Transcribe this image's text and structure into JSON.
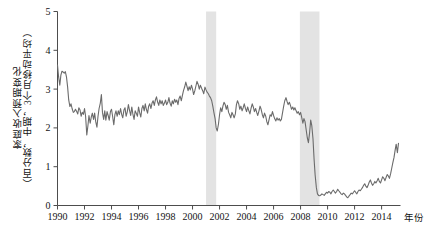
{
  "chart_data": {
    "type": "line",
    "title": "",
    "xlabel": "年份",
    "ylabel_lines": [
      "家庭收入预期变化",
      "（百分数，中期，3个月移动平均）"
    ],
    "ylabel": "家庭收入预期变化（百分数，中期，3个月移动平均）",
    "xlim": [
      1990,
      2015.4
    ],
    "ylim": [
      0,
      5
    ],
    "ytick_labels": [
      "0",
      "1",
      "2",
      "3",
      "4",
      "5"
    ],
    "yticks": [
      0,
      1,
      2,
      3,
      4,
      5
    ],
    "xtick_labels": [
      "1990",
      "1992",
      "1994",
      "1996",
      "1998",
      "2000",
      "2002",
      "2004",
      "2006",
      "2008",
      "2010",
      "2012",
      "2014"
    ],
    "xticks": [
      1990,
      1992,
      1994,
      1996,
      1998,
      2000,
      2002,
      2004,
      2006,
      2008,
      2010,
      2012,
      2014
    ],
    "grid": false,
    "legend": null,
    "line_color": "#6b6b6b",
    "shade_color": "#e3e3e3",
    "axis_color": "#4d4d4d",
    "recession_bands": [
      {
        "start": 2001.0,
        "end": 2001.75
      },
      {
        "start": 2007.95,
        "end": 2009.4
      }
    ],
    "series": [
      {
        "name": "家庭收入预期变化",
        "x": [
          1990.0,
          1990.08,
          1990.17,
          1990.25,
          1990.33,
          1990.42,
          1990.5,
          1990.58,
          1990.67,
          1990.75,
          1990.83,
          1990.92,
          1991.0,
          1991.08,
          1991.17,
          1991.25,
          1991.33,
          1991.42,
          1991.5,
          1991.58,
          1991.67,
          1991.75,
          1991.83,
          1991.92,
          1992.0,
          1992.08,
          1992.17,
          1992.25,
          1992.33,
          1992.42,
          1992.5,
          1992.58,
          1992.67,
          1992.75,
          1992.83,
          1992.92,
          1993.0,
          1993.08,
          1993.17,
          1993.25,
          1993.33,
          1993.42,
          1993.5,
          1993.58,
          1993.67,
          1993.75,
          1993.83,
          1993.92,
          1994.0,
          1994.08,
          1994.17,
          1994.25,
          1994.33,
          1994.42,
          1994.5,
          1994.58,
          1994.67,
          1994.75,
          1994.83,
          1994.92,
          1995.0,
          1995.08,
          1995.17,
          1995.25,
          1995.33,
          1995.42,
          1995.5,
          1995.58,
          1995.67,
          1995.75,
          1995.83,
          1995.92,
          1996.0,
          1996.08,
          1996.17,
          1996.25,
          1996.33,
          1996.42,
          1996.5,
          1996.58,
          1996.67,
          1996.75,
          1996.83,
          1996.92,
          1997.0,
          1997.08,
          1997.17,
          1997.25,
          1997.33,
          1997.42,
          1997.5,
          1997.58,
          1997.67,
          1997.75,
          1997.83,
          1997.92,
          1998.0,
          1998.08,
          1998.17,
          1998.25,
          1998.33,
          1998.42,
          1998.5,
          1998.58,
          1998.67,
          1998.75,
          1998.83,
          1998.92,
          1999.0,
          1999.08,
          1999.17,
          1999.25,
          1999.33,
          1999.42,
          1999.5,
          1999.58,
          1999.67,
          1999.75,
          1999.83,
          1999.92,
          2000.0,
          2000.08,
          2000.17,
          2000.25,
          2000.33,
          2000.42,
          2000.5,
          2000.58,
          2000.67,
          2000.75,
          2000.83,
          2000.92,
          2001.0,
          2001.08,
          2001.17,
          2001.25,
          2001.33,
          2001.42,
          2001.5,
          2001.58,
          2001.67,
          2001.75,
          2001.83,
          2001.92,
          2002.0,
          2002.08,
          2002.17,
          2002.25,
          2002.33,
          2002.42,
          2002.5,
          2002.58,
          2002.67,
          2002.75,
          2002.83,
          2002.92,
          2003.0,
          2003.08,
          2003.17,
          2003.25,
          2003.33,
          2003.42,
          2003.5,
          2003.58,
          2003.67,
          2003.75,
          2003.83,
          2003.92,
          2004.0,
          2004.08,
          2004.17,
          2004.25,
          2004.33,
          2004.42,
          2004.5,
          2004.58,
          2004.67,
          2004.75,
          2004.83,
          2004.92,
          2005.0,
          2005.08,
          2005.17,
          2005.25,
          2005.33,
          2005.42,
          2005.5,
          2005.58,
          2005.67,
          2005.75,
          2005.83,
          2005.92,
          2006.0,
          2006.08,
          2006.17,
          2006.25,
          2006.33,
          2006.42,
          2006.5,
          2006.58,
          2006.67,
          2006.75,
          2006.83,
          2006.92,
          2007.0,
          2007.08,
          2007.17,
          2007.25,
          2007.33,
          2007.42,
          2007.5,
          2007.58,
          2007.67,
          2007.75,
          2007.83,
          2007.92,
          2008.0,
          2008.08,
          2008.17,
          2008.25,
          2008.33,
          2008.42,
          2008.5,
          2008.58,
          2008.67,
          2008.75,
          2008.83,
          2008.92,
          2009.0,
          2009.08,
          2009.17,
          2009.25,
          2009.33,
          2009.42,
          2009.5,
          2009.58,
          2009.67,
          2009.75,
          2009.83,
          2009.92,
          2010.0,
          2010.08,
          2010.17,
          2010.25,
          2010.33,
          2010.42,
          2010.5,
          2010.58,
          2010.67,
          2010.75,
          2010.83,
          2010.92,
          2011.0,
          2011.08,
          2011.17,
          2011.25,
          2011.33,
          2011.42,
          2011.5,
          2011.58,
          2011.67,
          2011.75,
          2011.83,
          2011.92,
          2012.0,
          2012.08,
          2012.17,
          2012.25,
          2012.33,
          2012.42,
          2012.5,
          2012.58,
          2012.67,
          2012.75,
          2012.83,
          2012.92,
          2013.0,
          2013.08,
          2013.17,
          2013.25,
          2013.33,
          2013.42,
          2013.5,
          2013.58,
          2013.67,
          2013.75,
          2013.83,
          2013.92,
          2014.0,
          2014.08,
          2014.17,
          2014.25,
          2014.33,
          2014.42,
          2014.5,
          2014.58,
          2014.67,
          2014.75,
          2014.83,
          2014.92,
          2015.0,
          2015.08,
          2015.17,
          2015.25
        ],
        "values": [
          3.62,
          3.32,
          3.1,
          3.36,
          3.46,
          3.44,
          3.41,
          3.45,
          3.3,
          3.05,
          2.72,
          2.55,
          2.62,
          2.5,
          2.4,
          2.42,
          2.48,
          2.42,
          2.36,
          2.52,
          2.46,
          2.3,
          2.4,
          2.35,
          2.5,
          2.3,
          1.82,
          2.05,
          2.32,
          2.12,
          2.28,
          2.38,
          2.22,
          2.38,
          2.16,
          2.02,
          2.3,
          2.5,
          2.64,
          2.86,
          2.4,
          2.22,
          2.44,
          2.2,
          2.42,
          2.32,
          2.2,
          2.42,
          2.48,
          2.3,
          2.08,
          2.34,
          2.44,
          2.3,
          2.44,
          2.34,
          2.5,
          2.35,
          2.26,
          2.46,
          2.52,
          2.3,
          2.42,
          2.6,
          2.46,
          2.32,
          2.54,
          2.36,
          2.22,
          2.44,
          2.38,
          2.3,
          2.54,
          2.4,
          2.28,
          2.5,
          2.58,
          2.44,
          2.62,
          2.48,
          2.38,
          2.56,
          2.62,
          2.5,
          2.64,
          2.7,
          2.58,
          2.72,
          2.8,
          2.66,
          2.58,
          2.72,
          2.62,
          2.7,
          2.58,
          2.64,
          2.72,
          2.6,
          2.66,
          2.78,
          2.64,
          2.56,
          2.7,
          2.62,
          2.74,
          2.66,
          2.72,
          2.6,
          2.76,
          2.82,
          2.7,
          2.84,
          2.96,
          3.06,
          3.18,
          3.08,
          2.96,
          3.06,
          2.98,
          3.1,
          3.0,
          2.86,
          2.96,
          3.08,
          3.2,
          3.12,
          3.0,
          3.1,
          3.02,
          2.96,
          2.88,
          3.05,
          2.98,
          2.92,
          2.88,
          2.82,
          2.78,
          2.7,
          2.56,
          2.4,
          2.24,
          2.0,
          1.92,
          2.1,
          2.34,
          2.52,
          2.42,
          2.56,
          2.66,
          2.6,
          2.48,
          2.58,
          2.4,
          2.34,
          2.26,
          2.4,
          2.34,
          2.26,
          2.36,
          2.6,
          2.7,
          2.62,
          2.48,
          2.56,
          2.44,
          2.52,
          2.62,
          2.5,
          2.42,
          2.54,
          2.44,
          2.36,
          2.5,
          2.62,
          2.54,
          2.42,
          2.5,
          2.4,
          2.32,
          2.44,
          2.56,
          2.48,
          2.34,
          2.26,
          2.38,
          2.3,
          2.16,
          2.08,
          2.22,
          2.34,
          2.3,
          2.42,
          2.32,
          2.24,
          2.18,
          2.26,
          2.2,
          2.24,
          2.18,
          2.22,
          2.4,
          2.56,
          2.7,
          2.78,
          2.68,
          2.6,
          2.66,
          2.58,
          2.48,
          2.54,
          2.46,
          2.52,
          2.44,
          2.38,
          2.42,
          2.34,
          2.4,
          2.28,
          2.12,
          2.24,
          2.16,
          1.94,
          1.74,
          1.62,
          1.88,
          2.2,
          2.06,
          1.72,
          1.2,
          0.78,
          0.46,
          0.3,
          0.26,
          0.25,
          0.27,
          0.3,
          0.28,
          0.26,
          0.3,
          0.34,
          0.32,
          0.36,
          0.34,
          0.3,
          0.36,
          0.4,
          0.36,
          0.32,
          0.36,
          0.42,
          0.38,
          0.34,
          0.3,
          0.28,
          0.32,
          0.3,
          0.26,
          0.22,
          0.2,
          0.24,
          0.28,
          0.32,
          0.3,
          0.34,
          0.38,
          0.34,
          0.3,
          0.36,
          0.4,
          0.38,
          0.42,
          0.46,
          0.52,
          0.56,
          0.5,
          0.46,
          0.52,
          0.6,
          0.66,
          0.58,
          0.52,
          0.56,
          0.62,
          0.58,
          0.64,
          0.7,
          0.62,
          0.58,
          0.66,
          0.74,
          0.7,
          0.64,
          0.72,
          0.8,
          0.76,
          0.7,
          0.82,
          0.96,
          1.1,
          1.24,
          1.42,
          1.58,
          1.36,
          1.6
        ]
      }
    ]
  }
}
